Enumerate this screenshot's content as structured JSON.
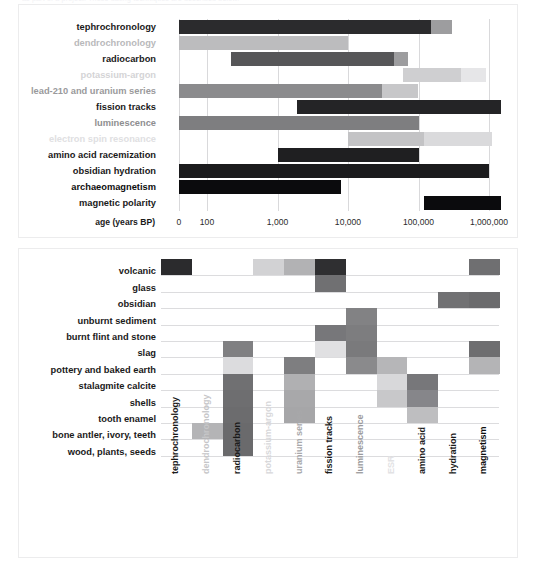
{
  "clipped_header": "as part of a project. These dating techniques are described below.",
  "chart_data": [
    {
      "type": "bar",
      "subtype": "horizontal-range-log",
      "title": "",
      "xlabel": "age (years BP)",
      "ylabel": "",
      "axis_title": "age (years BP)",
      "tick_labels": [
        "0",
        "100",
        "1,000",
        "10,000",
        "100,000",
        "1,000,000"
      ],
      "tick_values": [
        0,
        100,
        1000,
        10000,
        100000,
        1000000
      ],
      "grid": true,
      "legend": "none",
      "note": "Horizontal bars span the applicable dating range of each method; lighter trailing segment = less reliable / extended range.",
      "categories": [
        "tephrochronology",
        "dendrochronology",
        "radiocarbon",
        "potassium-argon",
        "lead-210 and uranium series",
        "fission tracks",
        "luminescence",
        "electron spin resonance",
        "amino acid racemization",
        "obsidian hydration",
        "archaeomagnetism",
        "magnetic polarity"
      ],
      "label_colors": [
        "#1a1a1a",
        "#b9b9bb",
        "#1a1a1a",
        "#d4d4d6",
        "#9a9a9c",
        "#1a1a1a",
        "#8e8e90",
        "#e0e0e2",
        "#1a1a1a",
        "#1a1a1a",
        "#0d0d0d",
        "#1a1a1a"
      ],
      "series": [
        {
          "name": "tephrochronology",
          "segments": [
            {
              "start": 0,
              "end": 150000,
              "color": "#2b2b2d"
            },
            {
              "start": 150000,
              "end": 300000,
              "color": "#9d9d9f"
            }
          ]
        },
        {
          "name": "dendrochronology",
          "segments": [
            {
              "start": 0,
              "end": 10000,
              "color": "#bcbcbe"
            }
          ]
        },
        {
          "name": "radiocarbon",
          "segments": [
            {
              "start": 220,
              "end": 45000,
              "color": "#565658"
            },
            {
              "start": 45000,
              "end": 70000,
              "color": "#9d9d9f"
            }
          ]
        },
        {
          "name": "potassium-argon",
          "segments": [
            {
              "start": 60000,
              "end": 400000,
              "color": "#cfcfd1"
            },
            {
              "start": 400000,
              "end": 900000,
              "color": "#e6e6e8"
            }
          ]
        },
        {
          "name": "lead-210 and uranium series",
          "segments": [
            {
              "start": 0,
              "end": 30000,
              "color": "#8b8b8d"
            },
            {
              "start": 30000,
              "end": 100000,
              "color": "#c7c7c9"
            }
          ]
        },
        {
          "name": "fission tracks",
          "segments": [
            {
              "start": 1900,
              "end": 1500000,
              "color": "#242426"
            }
          ]
        },
        {
          "name": "luminescence",
          "segments": [
            {
              "start": 0,
              "end": 100000,
              "color": "#7e7e80"
            }
          ]
        },
        {
          "name": "electron spin resonance",
          "segments": [
            {
              "start": 10000,
              "end": 120000,
              "color": "#c3c3c5"
            },
            {
              "start": 120000,
              "end": 1100000,
              "color": "#dadadc"
            }
          ]
        },
        {
          "name": "amino acid racemization",
          "segments": [
            {
              "start": 1000,
              "end": 100000,
              "color": "#1f1f21"
            }
          ]
        },
        {
          "name": "obsidian hydration",
          "segments": [
            {
              "start": 0,
              "end": 1000000,
              "color": "#1b1b1d"
            }
          ]
        },
        {
          "name": "archaeomagnetism",
          "segments": [
            {
              "start": 0,
              "end": 8000,
              "color": "#0b0b0d"
            }
          ]
        },
        {
          "name": "magnetic polarity",
          "segments": [
            {
              "start": 120000,
              "end": 1500000,
              "color": "#0b0b0d"
            }
          ]
        }
      ]
    },
    {
      "type": "heatmap",
      "subtype": "material-method-matrix",
      "title": "",
      "xlabel": "",
      "ylabel": "",
      "grid": true,
      "legend": "none",
      "note": "Shaded cells indicate which dating method applies to which material; darker shade = more applicable.",
      "categories_x": [
        "tephrochronology",
        "dendrochronology",
        "radiocarbon",
        "potassium-argon",
        "uranium series",
        "fission tracks",
        "luminescence",
        "ESR",
        "amino acid",
        "hydration",
        "magnetism"
      ],
      "x_label_colors": [
        "#1a1a1a",
        "#c6c6c8",
        "#1a1a1a",
        "#d8d8da",
        "#a8a8aa",
        "#1a1a1a",
        "#9a9a9c",
        "#e2e2e4",
        "#1a1a1a",
        "#1a1a1a",
        "#0d0d0d"
      ],
      "categories_y": [
        "volcanic",
        "glass",
        "obsidian",
        "unburnt sediment",
        "burnt flint and stone",
        "slag",
        "pottery and baked earth",
        "stalagmite calcite",
        "shells",
        "tooth enamel",
        "bone antler, ivory, teeth",
        "wood, plants, seeds"
      ],
      "cells": [
        {
          "row": "volcanic",
          "col": "tephrochronology",
          "color": "#2b2b2d"
        },
        {
          "row": "volcanic",
          "col": "potassium-argon",
          "color": "#d2d2d4"
        },
        {
          "row": "volcanic",
          "col": "uranium series",
          "color": "#b2b2b4"
        },
        {
          "row": "volcanic",
          "col": "fission tracks",
          "color": "#2f2f31"
        },
        {
          "row": "volcanic",
          "col": "magnetism",
          "color": "#6f6f71"
        },
        {
          "row": "glass",
          "col": "fission tracks",
          "color": "#707072"
        },
        {
          "row": "obsidian",
          "col": "hydration",
          "color": "#717173"
        },
        {
          "row": "obsidian",
          "col": "magnetism",
          "color": "#6b6b6d"
        },
        {
          "row": "unburnt sediment",
          "col": "luminescence",
          "color": "#828284"
        },
        {
          "row": "burnt flint and stone",
          "col": "luminescence",
          "color": "#7d7d7f"
        },
        {
          "row": "burnt flint and stone",
          "col": "fission tracks",
          "color": "#77777a"
        },
        {
          "row": "slag",
          "col": "radiocarbon",
          "color": "#808082"
        },
        {
          "row": "slag",
          "col": "fission tracks",
          "color": "#e0e0e2"
        },
        {
          "row": "slag",
          "col": "luminescence",
          "color": "#7a7a7c"
        },
        {
          "row": "slag",
          "col": "magnetism",
          "color": "#6e6e70"
        },
        {
          "row": "pottery and baked earth",
          "col": "radiocarbon",
          "color": "#dcdcde"
        },
        {
          "row": "pottery and baked earth",
          "col": "uranium series",
          "color": "#7e7e80"
        },
        {
          "row": "pottery and baked earth",
          "col": "luminescence",
          "color": "#8a8a8c"
        },
        {
          "row": "pottery and baked earth",
          "col": "ESR",
          "color": "#b6b6b8"
        },
        {
          "row": "pottery and baked earth",
          "col": "magnetism",
          "color": "#b4b4b6"
        },
        {
          "row": "stalagmite calcite",
          "col": "radiocarbon",
          "color": "#707072"
        },
        {
          "row": "stalagmite calcite",
          "col": "uranium series",
          "color": "#b0b0b2"
        },
        {
          "row": "stalagmite calcite",
          "col": "ESR",
          "color": "#d8d8da"
        },
        {
          "row": "stalagmite calcite",
          "col": "amino acid",
          "color": "#77777a"
        },
        {
          "row": "shells",
          "col": "radiocarbon",
          "color": "#6e6e70"
        },
        {
          "row": "shells",
          "col": "uranium series",
          "color": "#a8a8aa"
        },
        {
          "row": "shells",
          "col": "ESR",
          "color": "#c8c8ca"
        },
        {
          "row": "shells",
          "col": "amino acid",
          "color": "#86868a"
        },
        {
          "row": "tooth enamel",
          "col": "radiocarbon",
          "color": "#6c6c6e"
        },
        {
          "row": "tooth enamel",
          "col": "uranium series",
          "color": "#a6a6a8"
        },
        {
          "row": "tooth enamel",
          "col": "amino acid",
          "color": "#bebec0"
        },
        {
          "row": "bone antler, ivory, teeth",
          "col": "radiocarbon",
          "color": "#6a6a6c"
        },
        {
          "row": "bone antler, ivory, teeth",
          "col": "dendrochronology",
          "color": "#b4b4b6"
        },
        {
          "row": "wood, plants, seeds",
          "col": "radiocarbon",
          "color": "#6a6a6c"
        }
      ]
    }
  ]
}
